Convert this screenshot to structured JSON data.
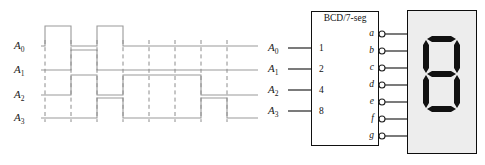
{
  "figure": {
    "type": "digital-logic-figure",
    "title_visible": false
  },
  "timing_diagram": {
    "signals": [
      {
        "name": "A0",
        "label": "A",
        "subscript": "0",
        "weight": 1
      },
      {
        "name": "A1",
        "label": "A",
        "subscript": "1",
        "weight": 2
      },
      {
        "name": "A2",
        "label": "A",
        "subscript": "2",
        "weight": 4
      },
      {
        "name": "A3",
        "label": "A",
        "subscript": "3",
        "weight": 8
      }
    ],
    "axis_color": "#9a9a9a",
    "dashed_color": "#8c8c8c",
    "row_baselines_px": [
      46,
      70,
      95,
      118
    ],
    "pulse_height_px": 20,
    "t_start_px": 41,
    "t_end_px": 258,
    "dashed_marker_x_px": [
      45,
      71,
      97,
      123,
      149,
      175,
      201,
      227
    ],
    "waveforms": {
      "A0": [
        {
          "x0": 41,
          "x1": 45,
          "level": 0
        },
        {
          "x0": 45,
          "x1": 71,
          "level": 1
        },
        {
          "x0": 71,
          "x1": 97,
          "level": 0
        },
        {
          "x0": 97,
          "x1": 123,
          "level": 1
        },
        {
          "x0": 123,
          "x1": 258,
          "level": 0
        }
      ],
      "A1": [
        {
          "x0": 41,
          "x1": 71,
          "level": 0
        },
        {
          "x0": 71,
          "x1": 97,
          "level": 1
        },
        {
          "x0": 97,
          "x1": 258,
          "level": 0
        }
      ],
      "A2": [
        {
          "x0": 41,
          "x1": 71,
          "level": 0
        },
        {
          "x0": 71,
          "x1": 97,
          "level": 1
        },
        {
          "x0": 97,
          "x1": 123,
          "level": 0
        },
        {
          "x0": 123,
          "x1": 201,
          "level": 1
        },
        {
          "x0": 201,
          "x1": 258,
          "level": 0
        }
      ],
      "A3": [
        {
          "x0": 41,
          "x1": 97,
          "level": 0
        },
        {
          "x0": 97,
          "x1": 123,
          "level": 1
        },
        {
          "x0": 123,
          "x1": 201,
          "level": 0
        },
        {
          "x0": 201,
          "x1": 227,
          "level": 1
        },
        {
          "x0": 227,
          "x1": 258,
          "level": 0
        }
      ]
    }
  },
  "decoder": {
    "title": "BCD/7-seg",
    "inputs": [
      {
        "signal_label": "A",
        "signal_sub": "0",
        "pin": "1"
      },
      {
        "signal_label": "A",
        "signal_sub": "1",
        "pin": "2"
      },
      {
        "signal_label": "A",
        "signal_sub": "2",
        "pin": "4"
      },
      {
        "signal_label": "A",
        "signal_sub": "3",
        "pin": "8"
      }
    ],
    "outputs": [
      {
        "label": "a",
        "bubble": true
      },
      {
        "label": "b",
        "bubble": true
      },
      {
        "label": "c",
        "bubble": true
      },
      {
        "label": "d",
        "bubble": true
      },
      {
        "label": "e",
        "bubble": true
      },
      {
        "label": "f",
        "bubble": true
      },
      {
        "label": "g",
        "bubble": true
      }
    ],
    "box_border_color": "#111111",
    "line_color": "#222222"
  },
  "seven_segment_display": {
    "displayed_digit": "8",
    "background_color": "#ededed",
    "segment_on_color": "#111111",
    "border_color": "#0d0d0d",
    "segments": {
      "a": true,
      "b": true,
      "c": true,
      "d": true,
      "e": true,
      "f": true,
      "g": true
    }
  }
}
